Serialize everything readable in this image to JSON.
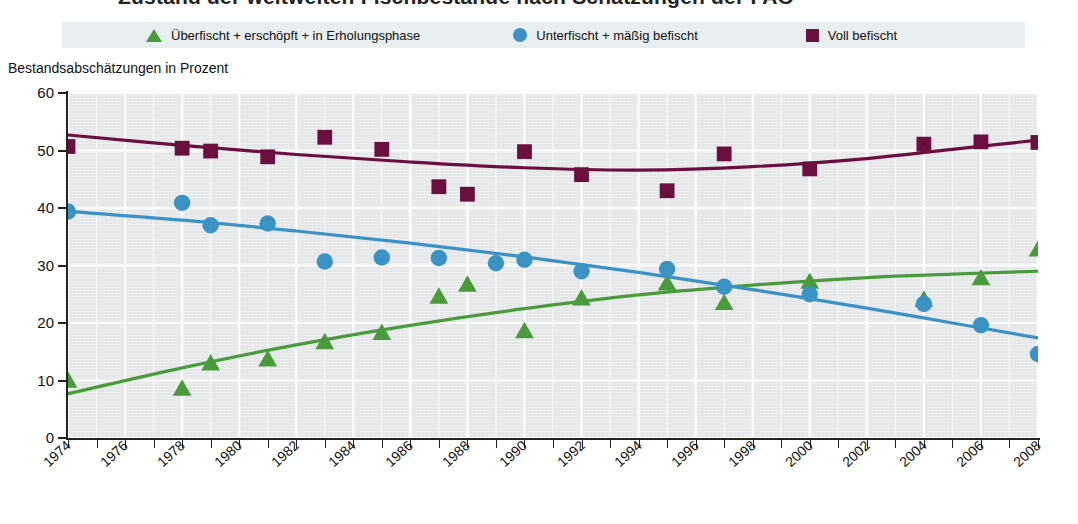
{
  "title": {
    "text": "Zustand der weltweiten Fischbestände nach Schätzungen der FAO"
  },
  "legend": {
    "items": [
      {
        "label": "Überfischt + erschöpft + in Erholungsphase",
        "marker": "triangle-marker",
        "color": "#4A9B3C"
      },
      {
        "label": "Unterfischt + mäßig befischt",
        "marker": "circle-marker",
        "color": "#3A93C4"
      },
      {
        "label": "Voll befischt",
        "marker": "square-marker",
        "color": "#6B0F3E"
      }
    ]
  },
  "axis": {
    "y_title": "Bestandsabschätzungen in Prozent",
    "y_ticks": [
      "60",
      "50",
      "40",
      "30",
      "20",
      "10",
      "0"
    ],
    "x_ticks": [
      "1974",
      "1976",
      "1978",
      "1980",
      "1982",
      "1984",
      "1986",
      "1988",
      "1990",
      "1992",
      "1994",
      "1996",
      "1998",
      "2000",
      "2002",
      "2004",
      "2006",
      "2008"
    ]
  },
  "chart_data": {
    "type": "scatter",
    "title": "Zustand der weltweiten Fischbestände nach Schätzungen der FAO",
    "xlabel": "",
    "ylabel": "Bestandsabschätzungen in Prozent",
    "xlim": [
      1974,
      2008
    ],
    "ylim": [
      0,
      60
    ],
    "ytick_step": 10,
    "xtick_label_step": 2,
    "xtick_minor_step": 1,
    "grid": true,
    "grid_color": "#ffffff",
    "plot_background": "#e4e6e8",
    "legend_position": "top",
    "series": [
      {
        "name": "Überfischt + erschöpft + in Erholungsphase",
        "color": "#4A9B3C",
        "marker": "triangle",
        "trend": "fitted-curve",
        "points": [
          {
            "x": 1974,
            "y": 10.0
          },
          {
            "x": 1978,
            "y": 8.6
          },
          {
            "x": 1979,
            "y": 13.0
          },
          {
            "x": 1981,
            "y": 13.7
          },
          {
            "x": 1983,
            "y": 16.7
          },
          {
            "x": 1985,
            "y": 18.3
          },
          {
            "x": 1987,
            "y": 24.6
          },
          {
            "x": 1988,
            "y": 26.7
          },
          {
            "x": 1990,
            "y": 18.6
          },
          {
            "x": 1992,
            "y": 24.3
          },
          {
            "x": 1995,
            "y": 26.9
          },
          {
            "x": 1997,
            "y": 23.5
          },
          {
            "x": 2000,
            "y": 27.2
          },
          {
            "x": 2004,
            "y": 24.1
          },
          {
            "x": 2006,
            "y": 27.8
          },
          {
            "x": 2008,
            "y": 32.8
          }
        ],
        "trend_points": [
          {
            "x": 1974,
            "y": 7.7
          },
          {
            "x": 1978,
            "y": 12.2
          },
          {
            "x": 1982,
            "y": 16.2
          },
          {
            "x": 1986,
            "y": 19.6
          },
          {
            "x": 1990,
            "y": 22.5
          },
          {
            "x": 1994,
            "y": 24.9
          },
          {
            "x": 1998,
            "y": 26.6
          },
          {
            "x": 2002,
            "y": 27.9
          },
          {
            "x": 2005,
            "y": 28.5
          },
          {
            "x": 2008,
            "y": 29.0
          }
        ]
      },
      {
        "name": "Unterfischt + mäßig befischt",
        "color": "#3A93C4",
        "marker": "circle",
        "trend": "fitted-curve",
        "points": [
          {
            "x": 1974,
            "y": 39.4
          },
          {
            "x": 1978,
            "y": 40.9
          },
          {
            "x": 1979,
            "y": 37.0
          },
          {
            "x": 1981,
            "y": 37.3
          },
          {
            "x": 1983,
            "y": 30.7
          },
          {
            "x": 1985,
            "y": 31.4
          },
          {
            "x": 1987,
            "y": 31.3
          },
          {
            "x": 1989,
            "y": 30.4
          },
          {
            "x": 1990,
            "y": 31.0
          },
          {
            "x": 1992,
            "y": 29.0
          },
          {
            "x": 1995,
            "y": 29.4
          },
          {
            "x": 1997,
            "y": 26.3
          },
          {
            "x": 2000,
            "y": 25.0
          },
          {
            "x": 2004,
            "y": 23.3
          },
          {
            "x": 2006,
            "y": 19.6
          },
          {
            "x": 2008,
            "y": 14.6
          }
        ],
        "trend_points": [
          {
            "x": 1974,
            "y": 39.4
          },
          {
            "x": 1978,
            "y": 37.9
          },
          {
            "x": 1982,
            "y": 36.0
          },
          {
            "x": 1986,
            "y": 33.9
          },
          {
            "x": 1990,
            "y": 31.5
          },
          {
            "x": 1994,
            "y": 28.8
          },
          {
            "x": 1998,
            "y": 25.8
          },
          {
            "x": 2002,
            "y": 22.6
          },
          {
            "x": 2005,
            "y": 20.0
          },
          {
            "x": 2008,
            "y": 17.4
          }
        ]
      },
      {
        "name": "Voll befischt",
        "color": "#6B0F3E",
        "marker": "square",
        "trend": "fitted-curve",
        "points": [
          {
            "x": 1974,
            "y": 50.7
          },
          {
            "x": 1978,
            "y": 50.4
          },
          {
            "x": 1979,
            "y": 49.9
          },
          {
            "x": 1981,
            "y": 48.9
          },
          {
            "x": 1983,
            "y": 52.3
          },
          {
            "x": 1985,
            "y": 50.2
          },
          {
            "x": 1987,
            "y": 43.7
          },
          {
            "x": 1988,
            "y": 42.4
          },
          {
            "x": 1990,
            "y": 49.8
          },
          {
            "x": 1992,
            "y": 45.8
          },
          {
            "x": 1995,
            "y": 43.0
          },
          {
            "x": 1997,
            "y": 49.4
          },
          {
            "x": 2000,
            "y": 46.8
          },
          {
            "x": 2004,
            "y": 51.1
          },
          {
            "x": 2006,
            "y": 51.5
          },
          {
            "x": 2008,
            "y": 51.4
          }
        ],
        "trend_points": [
          {
            "x": 1974,
            "y": 52.7
          },
          {
            "x": 1978,
            "y": 50.9
          },
          {
            "x": 1982,
            "y": 49.3
          },
          {
            "x": 1986,
            "y": 48.0
          },
          {
            "x": 1990,
            "y": 47.0
          },
          {
            "x": 1994,
            "y": 46.6
          },
          {
            "x": 1998,
            "y": 47.2
          },
          {
            "x": 2002,
            "y": 48.6
          },
          {
            "x": 2005,
            "y": 50.2
          },
          {
            "x": 2008,
            "y": 51.8
          }
        ]
      }
    ]
  }
}
